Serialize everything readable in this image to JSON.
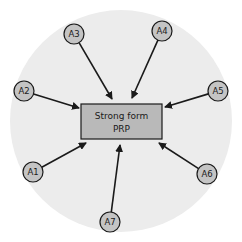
{
  "diagram": {
    "background_circle": {
      "cx": 121,
      "cy": 121,
      "r": 111,
      "fill": "#ececec"
    },
    "center_box": {
      "x": 81,
      "y": 104,
      "width": 81,
      "height": 35,
      "fill": "#b9b9b9",
      "stroke": "#1a1a1a",
      "line1": "Strong form",
      "line2": "PRP"
    },
    "node_style": {
      "r": 10,
      "fill": "#c4c4c4",
      "stroke": "#1a1a1a"
    },
    "nodes": [
      {
        "id": "A1",
        "label": "A1",
        "cx": 33,
        "cy": 172,
        "arrow_to": [
          86,
          143
        ]
      },
      {
        "id": "A2",
        "label": "A2",
        "cx": 24,
        "cy": 91,
        "arrow_to": [
          79,
          108
        ]
      },
      {
        "id": "A3",
        "label": "A3",
        "cx": 74,
        "cy": 34,
        "arrow_to": [
          112,
          99
        ]
      },
      {
        "id": "A4",
        "label": "A4",
        "cx": 162,
        "cy": 31,
        "arrow_to": [
          132,
          98
        ]
      },
      {
        "id": "A5",
        "label": "A5",
        "cx": 218,
        "cy": 91,
        "arrow_to": [
          165,
          107
        ]
      },
      {
        "id": "A6",
        "label": "A6",
        "cx": 207,
        "cy": 174,
        "arrow_to": [
          159,
          143
        ]
      },
      {
        "id": "A7",
        "label": "A7",
        "cx": 110,
        "cy": 222,
        "arrow_to": [
          120,
          145
        ]
      }
    ]
  }
}
